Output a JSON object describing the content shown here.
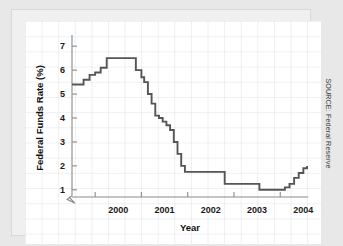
{
  "source_note": "SOURCE: Federal Reserve",
  "chart_data": {
    "type": "line",
    "line_style": "step",
    "title": "",
    "xlabel": "Year",
    "ylabel": "Federal Funds Rate (%)",
    "xlim": [
      1999.5,
      2004.6
    ],
    "ylim": [
      0.7,
      7.3
    ],
    "grid": true,
    "y_axis_break": true,
    "legend": "none",
    "yticks": [
      1,
      2,
      3,
      4,
      5,
      6,
      7
    ],
    "ytick_labels": [
      "1",
      "2",
      "3",
      "4",
      "5",
      "6",
      "7"
    ],
    "xticks": [
      2000,
      2001,
      2002,
      2003,
      2004
    ],
    "xtick_labels": [
      "2000",
      "2001",
      "2002",
      "2003",
      "2004"
    ],
    "series": [
      {
        "name": "Federal Funds Rate",
        "color": "#555555",
        "x": [
          1999.5,
          1999.62,
          1999.75,
          1999.88,
          2000.0,
          2000.12,
          2000.25,
          2000.38,
          2000.5,
          2000.62,
          2000.75,
          2000.88,
          2001.0,
          2001.06,
          2001.14,
          2001.22,
          2001.3,
          2001.38,
          2001.46,
          2001.54,
          2001.62,
          2001.7,
          2001.78,
          2001.86,
          2001.94,
          2002.0,
          2002.2,
          2002.4,
          2002.6,
          2002.8,
          2003.0,
          2003.2,
          2003.4,
          2003.55,
          2003.7,
          2003.9,
          2004.0,
          2004.1,
          2004.2,
          2004.3,
          2004.4,
          2004.5,
          2004.58
        ],
        "y": [
          5.4,
          5.4,
          5.6,
          5.8,
          5.9,
          6.1,
          6.5,
          6.5,
          6.5,
          6.5,
          6.5,
          6.0,
          5.7,
          5.5,
          5.0,
          4.6,
          4.1,
          4.0,
          3.85,
          3.7,
          3.5,
          3.0,
          2.5,
          2.0,
          1.75,
          1.75,
          1.75,
          1.75,
          1.75,
          1.25,
          1.25,
          1.25,
          1.25,
          1.0,
          1.0,
          1.0,
          1.0,
          1.1,
          1.25,
          1.5,
          1.7,
          1.9,
          2.0
        ]
      }
    ]
  }
}
